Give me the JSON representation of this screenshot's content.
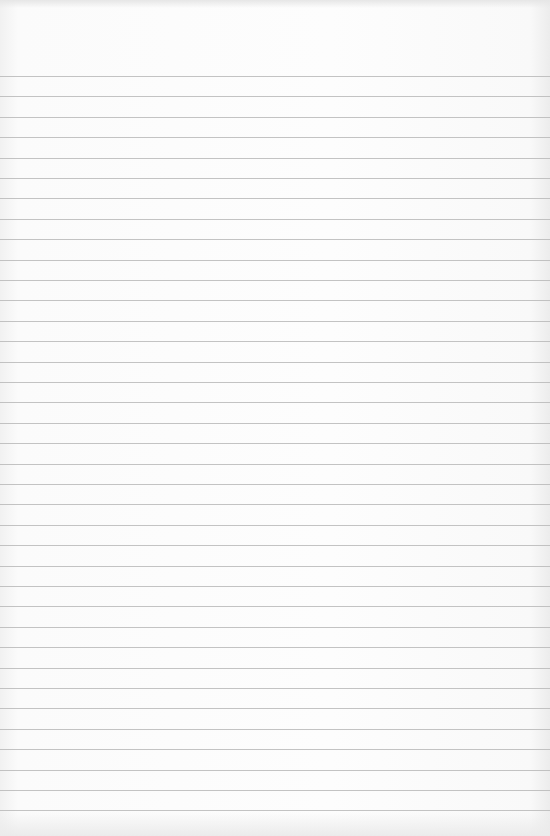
{
  "image": {
    "subject": "blank lined notebook paper",
    "paper_color": "#fbfbfb",
    "line_color": "#b9b9b9",
    "line_count": 37,
    "first_line_y": 76,
    "line_spacing_px": 20.4
  }
}
